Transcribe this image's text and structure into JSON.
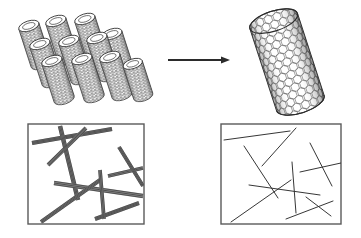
{
  "figure": {
    "type": "scientific-schematic",
    "background_color": "#ffffff",
    "stroke_color": "#2b2b2b",
    "panel_border_color": "#5a5a5a",
    "width": 361,
    "height": 238
  },
  "top_row": {
    "left_object": {
      "name": "nanotube-bundle",
      "description": "bundle of aligned single-walled carbon nanotubes",
      "tube_count": 11,
      "rows": 3,
      "tube_fill": "#ffffff",
      "tube_shading": "#9a9a9a",
      "tubes": [
        {
          "cx": 35,
          "cy": 45,
          "rx": 10.5,
          "ry": 5.0,
          "len": 40,
          "angle": 72
        },
        {
          "cx": 62,
          "cy": 40,
          "rx": 10.5,
          "ry": 5.0,
          "len": 40,
          "angle": 72
        },
        {
          "cx": 91,
          "cy": 38,
          "rx": 10.5,
          "ry": 5.0,
          "len": 40,
          "angle": 72
        },
        {
          "cx": 46,
          "cy": 63,
          "rx": 10.5,
          "ry": 5.0,
          "len": 40,
          "angle": 72
        },
        {
          "cx": 75,
          "cy": 60,
          "rx": 10.5,
          "ry": 5.0,
          "len": 40,
          "angle": 72
        },
        {
          "cx": 103,
          "cy": 57,
          "rx": 10.5,
          "ry": 5.0,
          "len": 40,
          "angle": 72
        },
        {
          "cx": 118,
          "cy": 53,
          "rx": 10.5,
          "ry": 5.0,
          "len": 40,
          "angle": 72
        },
        {
          "cx": 58,
          "cy": 80,
          "rx": 10.5,
          "ry": 5.0,
          "len": 40,
          "angle": 72
        },
        {
          "cx": 88,
          "cy": 78,
          "rx": 10.5,
          "ry": 5.0,
          "len": 40,
          "angle": 72
        },
        {
          "cx": 116,
          "cy": 76,
          "rx": 10.5,
          "ry": 5.0,
          "len": 40,
          "angle": 72
        },
        {
          "cx": 138,
          "cy": 80,
          "rx": 10.0,
          "ry": 4.8,
          "len": 34,
          "angle": 72
        }
      ]
    },
    "arrow": {
      "name": "transformation-arrow",
      "x1": 168,
      "y1": 60,
      "x2": 230,
      "y2": 60,
      "head_length": 9,
      "head_width": 7,
      "stroke_width": 2.0
    },
    "right_object": {
      "name": "individual-nanotube",
      "description": "single individualized carbon nanotube with hexagonal lattice",
      "tilt_angle": -18,
      "cx": 287,
      "cy": 62,
      "length": 86,
      "diameter": 50,
      "lattice": "honeycomb",
      "hex_size": 4.4
    }
  },
  "bottom_row": {
    "left_panel": {
      "name": "panel-bundled-nanotubes",
      "description": "AFM-style view of thick bundled nanotube ropes",
      "x": 28,
      "y": 124,
      "width": 116,
      "height": 100,
      "line_style": "multi-strand-ribbon",
      "strand_counts": [
        4,
        4,
        3,
        4,
        3,
        4,
        3,
        4,
        3
      ],
      "lines": [
        {
          "x1": 32,
          "y1": 143,
          "x2": 112,
          "y2": 129,
          "w": 3.2,
          "n": 4
        },
        {
          "x1": 48,
          "y1": 165,
          "x2": 86,
          "y2": 128,
          "w": 3.0,
          "n": 4
        },
        {
          "x1": 60,
          "y1": 126,
          "x2": 78,
          "y2": 200,
          "w": 3.4,
          "n": 4
        },
        {
          "x1": 54,
          "y1": 183,
          "x2": 143,
          "y2": 196,
          "w": 3.2,
          "n": 3
        },
        {
          "x1": 41,
          "y1": 222,
          "x2": 100,
          "y2": 180,
          "w": 3.0,
          "n": 4
        },
        {
          "x1": 100,
          "y1": 170,
          "x2": 104,
          "y2": 219,
          "w": 2.6,
          "n": 3
        },
        {
          "x1": 108,
          "y1": 176,
          "x2": 143,
          "y2": 168,
          "w": 2.6,
          "n": 3
        },
        {
          "x1": 119,
          "y1": 147,
          "x2": 143,
          "y2": 186,
          "w": 2.8,
          "n": 4
        },
        {
          "x1": 95,
          "y1": 219,
          "x2": 139,
          "y2": 203,
          "w": 3.0,
          "n": 4
        }
      ]
    },
    "right_panel": {
      "name": "panel-individual-nanotubes",
      "description": "AFM-style view of thin individualized nanotubes",
      "x": 221,
      "y": 124,
      "width": 120,
      "height": 100,
      "line_style": "single-thin-line",
      "lines": [
        {
          "x1": 224,
          "y1": 140,
          "x2": 290,
          "y2": 131
        },
        {
          "x1": 262,
          "y1": 166,
          "x2": 296,
          "y2": 128
        },
        {
          "x1": 244,
          "y1": 146,
          "x2": 278,
          "y2": 198
        },
        {
          "x1": 249,
          "y1": 185,
          "x2": 320,
          "y2": 195
        },
        {
          "x1": 231,
          "y1": 222,
          "x2": 291,
          "y2": 180
        },
        {
          "x1": 292,
          "y1": 162,
          "x2": 296,
          "y2": 213
        },
        {
          "x1": 300,
          "y1": 172,
          "x2": 341,
          "y2": 163
        },
        {
          "x1": 310,
          "y1": 143,
          "x2": 332,
          "y2": 186
        },
        {
          "x1": 286,
          "y1": 219,
          "x2": 333,
          "y2": 201
        },
        {
          "x1": 306,
          "y1": 197,
          "x2": 331,
          "y2": 216
        }
      ]
    }
  }
}
